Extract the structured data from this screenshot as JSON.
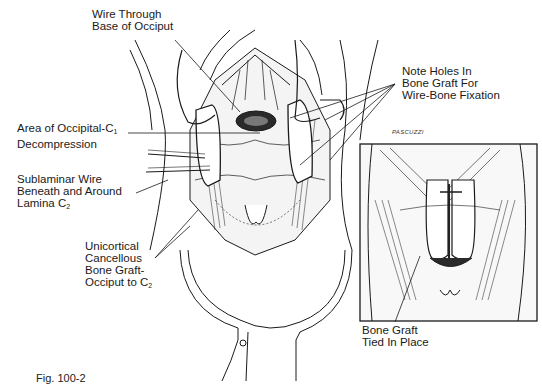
{
  "figure": {
    "caption": "Fig. 100-2",
    "signature": "PASCUZZI",
    "main_view": {
      "labels": [
        {
          "id": "wire-through-base-of-occiput",
          "lines": [
            "Wire Through",
            "Base of Occiput"
          ]
        },
        {
          "id": "area-of-occipital-c1-decompression",
          "lines": [
            "Area of Occipital-C",
            "Decompression"
          ],
          "subscript": "1"
        },
        {
          "id": "sublaminar-wire",
          "lines": [
            "Sublaminar Wire",
            "Beneath and Around",
            "Lamina C"
          ],
          "subscript": "2"
        },
        {
          "id": "unicortical-bone-graft",
          "lines": [
            "Unicortical",
            "Cancellous",
            "Bone Graft-",
            "Occiput to C"
          ],
          "subscript": "2"
        },
        {
          "id": "note-holes",
          "lines": [
            "Note Holes In",
            "Bone Graft For",
            "Wire-Bone Fixation"
          ]
        }
      ]
    },
    "inset_view": {
      "labels": [
        {
          "id": "bone-graft-tied",
          "lines": [
            "Bone Graft",
            "Tied In Place"
          ]
        }
      ]
    }
  }
}
